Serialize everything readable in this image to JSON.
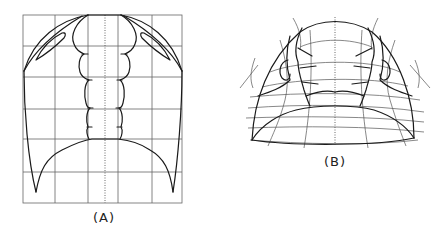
{
  "figures": [
    {
      "id": "A",
      "label": "(A)",
      "description": "Trilobite dorsal outline (cephalon + glabella) drawn on a rectangular reference grid",
      "grid": {
        "columns": 5,
        "rows": 6,
        "center_line": "dotted"
      }
    },
    {
      "id": "B",
      "label": "(B)",
      "description": "Same trilobite outline transformed onto a deformed curvilinear coordinate grid",
      "grid": {
        "type": "curvilinear",
        "center_line": "dotted"
      }
    }
  ],
  "colors": {
    "stroke": "#1a1a1a",
    "grid": "#555555",
    "background": "#ffffff"
  }
}
